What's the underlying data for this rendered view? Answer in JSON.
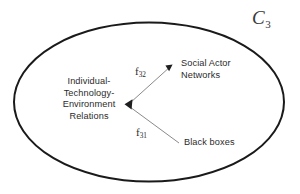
{
  "figure": {
    "type": "concept-diagram",
    "background_color": "#ffffff",
    "width": 300,
    "height": 194,
    "boundary": {
      "shape": "ellipse",
      "label": "C",
      "label_subscript": "3",
      "stroke_color": "#1a1a1a",
      "stroke_width": 2,
      "center_x": 149,
      "center_y": 102,
      "radius_x": 136,
      "radius_y": 80
    },
    "nodes": [
      {
        "id": "itev",
        "label": "Individual-\nTechnology-\nEnvironment\nRelations",
        "x": 89,
        "y": 104
      },
      {
        "id": "social-actor-networks",
        "label": "Social Actor\nNetworks",
        "x": 215,
        "y": 69
      },
      {
        "id": "black-boxes",
        "label": "Black boxes",
        "x": 213,
        "y": 143
      }
    ],
    "edges": [
      {
        "id": "f32",
        "label": "f",
        "label_subscript": "32",
        "from": "social-actor-networks",
        "to": "itev",
        "arrowheads": "both",
        "stroke_color": "#8a8a8a"
      },
      {
        "id": "f31",
        "label": "f",
        "label_subscript": "31",
        "from": "black-boxes",
        "to": "itev",
        "arrowheads": "target",
        "stroke_color": "#8a8a8a"
      }
    ],
    "text_color": "#2b2b2b"
  }
}
